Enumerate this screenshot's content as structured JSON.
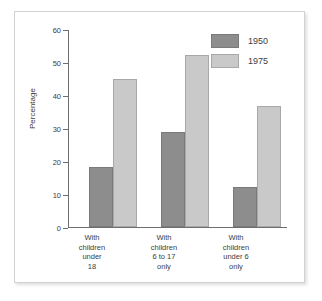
{
  "chart_data": {
    "type": "bar",
    "title": "",
    "subtitle": "",
    "xlabel": "",
    "ylabel": "Percentage",
    "ylim": [
      0,
      60
    ],
    "yticks": [
      0,
      10,
      20,
      30,
      40,
      50,
      60
    ],
    "ytick_labels": [
      "0",
      "10",
      "20",
      "30",
      "40",
      "50",
      "60"
    ],
    "grid": false,
    "legend_position": "top-right",
    "categories": [
      "With\nchildren\nunder\n18",
      "With\nchildren\n6 to 17\nonly",
      "With\nchildren\nunder 6\nonly"
    ],
    "category_lines": [
      [
        "With",
        "children",
        "under",
        "18"
      ],
      [
        "With",
        "children",
        "6 to 17",
        "only"
      ],
      [
        "With",
        "children",
        "under 6",
        "only"
      ]
    ],
    "series": [
      {
        "name": "1950",
        "color": "#8d8d8d",
        "values": [
          18.2,
          28.8,
          12.1
        ]
      },
      {
        "name": "1975",
        "color": "#c9c9c9",
        "values": [
          44.8,
          52.2,
          36.7
        ]
      }
    ]
  },
  "legend": {
    "items": [
      {
        "label": "1950"
      },
      {
        "label": "1975"
      }
    ]
  },
  "colors": {
    "series_1950": "#8d8d8d",
    "series_1975": "#c9c9c9",
    "axis": "#6e6e6e",
    "text": "#3d3d3d",
    "frame": "#d2d2d2",
    "background": "#ffffff"
  }
}
